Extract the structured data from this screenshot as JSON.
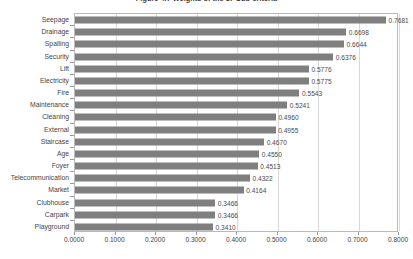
{
  "chart_data": {
    "type": "bar",
    "orientation": "horizontal",
    "title": "Figure 4.7  Weights of the 17 Sub-criteria",
    "xlabel": "",
    "ylabel": "",
    "xlim": [
      0.0,
      0.8
    ],
    "grid": true,
    "legend": false,
    "bar_color": "#7f7f7f",
    "x_ticks": [
      "0.0000",
      "0.1000",
      "0.2000",
      "0.3000",
      "0.4000",
      "0.5000",
      "0.6000",
      "0.7000",
      "0.8000"
    ],
    "x_tick_values": [
      0.0,
      0.1,
      0.2,
      0.3,
      0.4,
      0.5,
      0.6,
      0.7,
      0.8
    ],
    "categories": [
      "Seepage",
      "Drainage",
      "Spalling",
      "Security",
      "Lift",
      "Electricity",
      "Fire",
      "Maintenance",
      "Cleaning",
      "External",
      "Staircase",
      "Age",
      "Foyer",
      "Telecommunication",
      "Market",
      "Clubhouse",
      "Carpark",
      "Playground"
    ],
    "values": [
      0.7681,
      0.6698,
      0.6644,
      0.6376,
      0.5776,
      0.5775,
      0.5543,
      0.5241,
      0.496,
      0.4955,
      0.467,
      0.455,
      0.4513,
      0.4322,
      0.4164,
      0.3466,
      0.3466,
      0.341
    ],
    "data_labels": [
      "0.7681",
      "0.6698",
      "0.6644",
      "0.6376",
      "0.5776",
      "0.5775",
      "0.5543",
      "0.5241",
      "0.4960",
      "0.4955",
      "0.4670",
      "0.4550",
      "0.4513",
      "0.4322",
      "0.4164",
      "0.3466",
      "0.3466",
      "0.3410"
    ]
  }
}
